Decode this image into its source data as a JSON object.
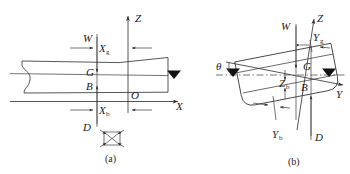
{
  "figure": {
    "line_color": "#2b2b2b",
    "marker_color": "#111111",
    "background": "#ffffff",
    "panels": [
      {
        "id": "a",
        "caption": "(a)",
        "view": "profile / longitudinal upright view",
        "axes": [
          {
            "name": "Z",
            "label": "Z",
            "direction": "up"
          },
          {
            "name": "X",
            "label": "X",
            "direction": "right"
          }
        ],
        "points": [
          {
            "name": "O",
            "label": "O",
            "desc": "origin at baseline on midship vertical"
          },
          {
            "name": "G",
            "label": "G",
            "desc": "centre of gravity"
          },
          {
            "name": "B",
            "label": "B",
            "desc": "centre of buoyancy"
          }
        ],
        "force_labels": [
          {
            "name": "W",
            "label": "W",
            "desc": "weight acting downward through G"
          },
          {
            "name": "D",
            "label": "D",
            "desc": "buoyancy acting upward through B"
          }
        ],
        "dimensions": [
          {
            "name": "Xg",
            "base": "X",
            "sub": "g",
            "desc": "longitudinal position of G"
          },
          {
            "name": "Xb",
            "base": "X",
            "sub": "b",
            "desc": "longitudinal position of B"
          }
        ],
        "markers": [
          {
            "name": "waterline-marker",
            "glyph": "solid triangle",
            "desc": "waterline level indicator at hull side"
          }
        ]
      },
      {
        "id": "b",
        "caption": "(b)",
        "view": "transverse body section, heeled",
        "heel_angle_label": "θ",
        "axes": [
          {
            "name": "Z",
            "label": "Z",
            "direction": "up (inclined)"
          },
          {
            "name": "Y",
            "label": "Y",
            "direction": "right (inclined)"
          }
        ],
        "points": [
          {
            "name": "G",
            "label": "G",
            "desc": "centre of gravity"
          },
          {
            "name": "B",
            "label": "B",
            "desc": "centre of buoyancy"
          }
        ],
        "force_labels": [
          {
            "name": "W",
            "label": "W",
            "desc": "weight acting downward through G"
          },
          {
            "name": "D",
            "label": "D",
            "desc": "buoyancy acting upward through B"
          }
        ],
        "dimensions": [
          {
            "name": "Yg",
            "base": "Y",
            "sub": "g",
            "desc": "transverse position of G"
          },
          {
            "name": "Yb",
            "base": "Y",
            "sub": "b",
            "desc": "transverse position of B"
          },
          {
            "name": "Zb",
            "base": "Z",
            "sub": "b",
            "desc": "vertical position of B"
          }
        ],
        "markers": [
          {
            "name": "waterline-marker-left",
            "glyph": "solid triangle"
          },
          {
            "name": "waterline-marker-right",
            "glyph": "solid triangle"
          }
        ]
      }
    ]
  }
}
